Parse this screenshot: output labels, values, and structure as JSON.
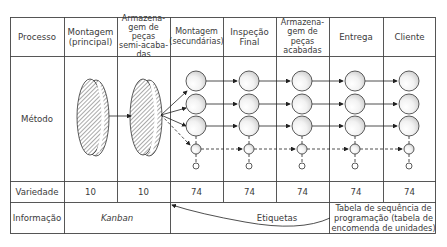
{
  "header": {
    "row_label": "Processo",
    "columns": [
      "Montagem (principal)",
      "Armazena-gem de peças semi-acaba-das",
      "Montagem (secundárias)",
      "Inspeção Final",
      "Armazena-gem de peças acabadas",
      "Entrega",
      "Cliente"
    ],
    "col_lines": {
      "c0": [
        "Montagem",
        "(principal)"
      ],
      "c1": [
        "Armazena-",
        "gem de peças",
        "semi-acaba-",
        "das"
      ],
      "c2": [
        "Montagem",
        "(secundárias)"
      ],
      "c3": [
        "Inspeção",
        "Final"
      ],
      "c4": [
        "Armazena-",
        "gem de peças",
        "acabadas"
      ],
      "c5": [
        "Entrega"
      ],
      "c6": [
        "Cliente"
      ]
    }
  },
  "method": {
    "row_label": "Método"
  },
  "variety": {
    "row_label": "Variedade",
    "values": [
      "10",
      "10",
      "74",
      "74",
      "74",
      "74",
      "74"
    ]
  },
  "information": {
    "row_label": "Informação",
    "kanban": "Kanban",
    "labels": "Etiquetas",
    "schedule_lines": [
      "Tabela de sequência de",
      "programação (tabela de",
      "encomenda de unidades)"
    ]
  }
}
